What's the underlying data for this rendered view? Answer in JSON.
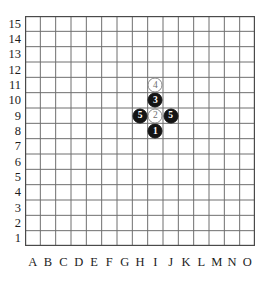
{
  "board": {
    "title": "Gomoku board diagram",
    "size": 15,
    "column_labels": [
      "A",
      "B",
      "C",
      "D",
      "E",
      "F",
      "G",
      "H",
      "I",
      "J",
      "K",
      "L",
      "M",
      "N",
      "O"
    ],
    "row_labels": [
      "15",
      "14",
      "13",
      "12",
      "11",
      "10",
      "9",
      "8",
      "7",
      "6",
      "5",
      "4",
      "3",
      "2",
      "1"
    ],
    "grid_color": "#6f6f6f",
    "border_color": "#4a4a4a",
    "background_color": "#ffffff",
    "label_color": "#1c1c1c"
  },
  "stones": [
    {
      "id": "stone-1",
      "number": "1",
      "color": "black",
      "column": "I",
      "row": "8",
      "col_index": 8,
      "row_index": 7
    },
    {
      "id": "stone-2",
      "number": "2",
      "color": "white",
      "column": "I",
      "row": "9",
      "col_index": 8,
      "row_index": 6
    },
    {
      "id": "stone-3",
      "number": "3",
      "color": "black",
      "column": "I",
      "row": "10",
      "col_index": 8,
      "row_index": 5
    },
    {
      "id": "stone-4",
      "number": "4",
      "color": "white",
      "column": "I",
      "row": "11",
      "col_index": 8,
      "row_index": 4
    },
    {
      "id": "stone-5a",
      "number": "5",
      "color": "black",
      "column": "H",
      "row": "9",
      "col_index": 7,
      "row_index": 6
    },
    {
      "id": "stone-5b",
      "number": "5",
      "color": "black",
      "column": "J",
      "row": "9",
      "col_index": 9,
      "row_index": 6
    }
  ]
}
